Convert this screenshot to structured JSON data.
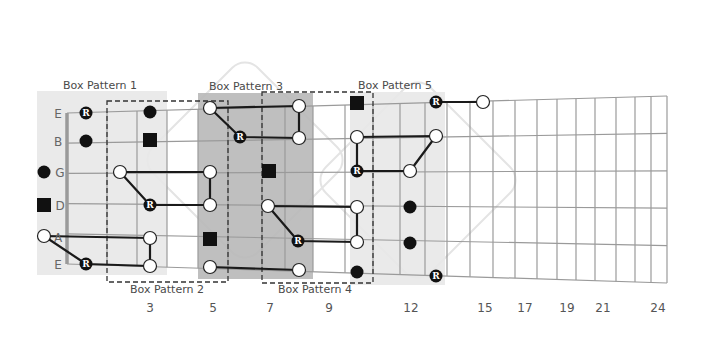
{
  "diagram": {
    "colors": {
      "background": "#ffffff",
      "string_line": "#9a9a9a",
      "fret_line": "#9a9a9a",
      "nut": "#9a9a9a",
      "shade_light": "#e8e8e8",
      "shade_dark": "#b8b8b8",
      "connector": "#1a1a1a",
      "note_fill_black": "#111111",
      "note_fill_white": "#ffffff",
      "watermark": "#e4e4e4",
      "dashed_box": "#333333"
    },
    "strings": [
      {
        "name": "E",
        "y_left": 113,
        "y_right": 96
      },
      {
        "name": "B",
        "y_left": 141,
        "y_right": 188
      },
      {
        "name": "G",
        "y_left": 172,
        "y_right": 171
      },
      {
        "name": "D",
        "y_left": 205,
        "y_right": 212
      },
      {
        "name": "A",
        "y_left": 237,
        "y_right": 250
      },
      {
        "name": "E",
        "y_left": 264,
        "y_right": 283
      }
    ],
    "string_geometry": {
      "x_left": 67,
      "x_right": 667,
      "top_left": 113,
      "top_right": 96,
      "bottom_left": 264,
      "bottom_right": 283
    },
    "nut_x": 67,
    "fret_x": [
      107,
      137,
      167,
      198,
      228,
      262,
      285,
      313,
      345,
      373,
      400,
      425,
      447,
      470,
      493,
      515,
      537,
      557,
      576,
      595,
      616,
      635,
      651,
      667
    ],
    "fret_numbers": [
      {
        "label": "3",
        "x": 150
      },
      {
        "label": "5",
        "x": 213
      },
      {
        "label": "7",
        "x": 270
      },
      {
        "label": "9",
        "x": 329
      },
      {
        "label": "12",
        "x": 411
      },
      {
        "label": "15",
        "x": 485
      },
      {
        "label": "17",
        "x": 525
      },
      {
        "label": "19",
        "x": 567
      },
      {
        "label": "21",
        "x": 603
      },
      {
        "label": "24",
        "x": 658
      }
    ],
    "fret_numbers_y": 312,
    "string_labels": [
      {
        "text": "E",
        "x": 58,
        "y": 113
      },
      {
        "text": "B",
        "x": 58,
        "y": 141
      },
      {
        "text": "G",
        "x": 60,
        "y": 172
      },
      {
        "text": "D",
        "x": 60,
        "y": 205
      },
      {
        "text": "A",
        "x": 58,
        "y": 237
      },
      {
        "text": "E",
        "x": 58,
        "y": 264
      }
    ],
    "shaded_boxes": [
      {
        "name": "box-pattern-1-shade",
        "x": 37,
        "y": 91,
        "w": 130,
        "h": 184,
        "tone": "light"
      },
      {
        "name": "box-pattern-3-shade",
        "x": 198,
        "y": 93,
        "w": 115,
        "h": 186,
        "tone": "dark"
      },
      {
        "name": "box-pattern-5-shade",
        "x": 350,
        "y": 92,
        "w": 95,
        "h": 193,
        "tone": "light"
      }
    ],
    "dashed_boxes": [
      {
        "name": "box-pattern-2-outline",
        "x": 107,
        "y": 101,
        "w": 121,
        "h": 181
      },
      {
        "name": "box-pattern-4-outline",
        "x": 262,
        "y": 92,
        "w": 111,
        "h": 191
      }
    ],
    "box_labels": [
      {
        "text": "Box Pattern 1",
        "x": 100,
        "y": 89
      },
      {
        "text": "Box Pattern 2",
        "x": 167,
        "y": 293
      },
      {
        "text": "Box Pattern 3",
        "x": 246,
        "y": 90
      },
      {
        "text": "Box Pattern 4",
        "x": 315,
        "y": 293
      },
      {
        "text": "Box Pattern 5",
        "x": 395,
        "y": 89
      }
    ],
    "connectors": [
      [
        [
          44,
          236
        ],
        [
          150,
          238
        ],
        [
          150,
          266
        ],
        [
          86,
          264
        ],
        [
          44,
          236
        ]
      ],
      [
        [
          120,
          172
        ],
        [
          210,
          172
        ],
        [
          210,
          205
        ],
        [
          150,
          205
        ],
        [
          120,
          172
        ]
      ],
      [
        [
          210,
          108
        ],
        [
          299,
          106
        ],
        [
          299,
          138
        ],
        [
          240,
          137
        ],
        [
          210,
          108
        ]
      ],
      [
        [
          210,
          267
        ],
        [
          299,
          270
        ]
      ],
      [
        [
          268,
          206
        ],
        [
          357,
          207
        ],
        [
          357,
          242
        ],
        [
          298,
          241
        ],
        [
          268,
          206
        ]
      ],
      [
        [
          357,
          137
        ],
        [
          436,
          136
        ],
        [
          410,
          171
        ],
        [
          357,
          171
        ],
        [
          357,
          137
        ]
      ],
      [
        [
          436,
          102
        ],
        [
          483,
          102
        ]
      ]
    ],
    "notes": [
      {
        "type": "root",
        "x": 86,
        "y": 113
      },
      {
        "type": "black",
        "x": 86,
        "y": 141
      },
      {
        "type": "black",
        "x": 150,
        "y": 112
      },
      {
        "type": "square",
        "x": 150,
        "y": 140
      },
      {
        "type": "black",
        "x": 44,
        "y": 172
      },
      {
        "type": "square",
        "x": 44,
        "y": 205
      },
      {
        "type": "white",
        "x": 44,
        "y": 236
      },
      {
        "type": "root",
        "x": 86,
        "y": 264
      },
      {
        "type": "white",
        "x": 150,
        "y": 238
      },
      {
        "type": "white",
        "x": 150,
        "y": 266
      },
      {
        "type": "white",
        "x": 120,
        "y": 172
      },
      {
        "type": "root",
        "x": 150,
        "y": 205
      },
      {
        "type": "white",
        "x": 210,
        "y": 172
      },
      {
        "type": "white",
        "x": 210,
        "y": 205
      },
      {
        "type": "square",
        "x": 210,
        "y": 239
      },
      {
        "type": "white",
        "x": 210,
        "y": 267
      },
      {
        "type": "white",
        "x": 210,
        "y": 108
      },
      {
        "type": "root",
        "x": 240,
        "y": 137
      },
      {
        "type": "white",
        "x": 299,
        "y": 106
      },
      {
        "type": "white",
        "x": 299,
        "y": 138
      },
      {
        "type": "square",
        "x": 269,
        "y": 171
      },
      {
        "type": "white",
        "x": 268,
        "y": 206
      },
      {
        "type": "root",
        "x": 298,
        "y": 241
      },
      {
        "type": "white",
        "x": 299,
        "y": 270
      },
      {
        "type": "white",
        "x": 357,
        "y": 207
      },
      {
        "type": "white",
        "x": 357,
        "y": 242
      },
      {
        "type": "black",
        "x": 357,
        "y": 272
      },
      {
        "type": "square",
        "x": 357,
        "y": 103
      },
      {
        "type": "white",
        "x": 357,
        "y": 137
      },
      {
        "type": "root",
        "x": 357,
        "y": 171
      },
      {
        "type": "white",
        "x": 436,
        "y": 136
      },
      {
        "type": "white",
        "x": 410,
        "y": 171
      },
      {
        "type": "black",
        "x": 410,
        "y": 207
      },
      {
        "type": "black",
        "x": 410,
        "y": 243
      },
      {
        "type": "root",
        "x": 436,
        "y": 276
      },
      {
        "type": "root",
        "x": 436,
        "y": 102
      },
      {
        "type": "white",
        "x": 483,
        "y": 102
      }
    ],
    "root_label": "R",
    "watermarks": [
      {
        "cx": 245,
        "cy": 160,
        "size": 210
      },
      {
        "cx": 418,
        "cy": 180,
        "size": 210
      }
    ]
  }
}
